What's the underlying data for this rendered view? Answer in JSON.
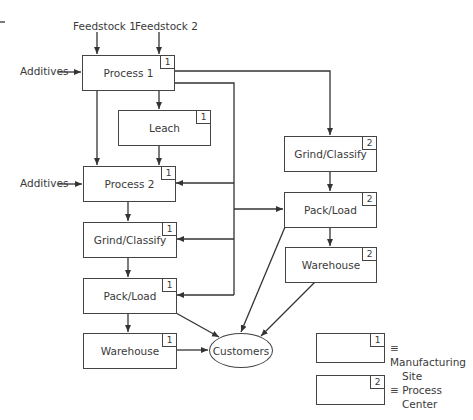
{
  "diagram": {
    "inputs": {
      "feedstock1": "Feedstock 1",
      "feedstock2": "Feedstock 2",
      "additives1": "Additives",
      "additives2": "Additives"
    },
    "site1": {
      "process1": {
        "label": "Process 1",
        "badge": "1"
      },
      "leach": {
        "label": "Leach",
        "badge": "1"
      },
      "process2": {
        "label": "Process 2",
        "badge": "1"
      },
      "grind": {
        "label": "Grind/Classify",
        "badge": "1"
      },
      "pack": {
        "label": "Pack/Load",
        "badge": "1"
      },
      "warehouse": {
        "label": "Warehouse",
        "badge": "1"
      }
    },
    "site2": {
      "grind": {
        "label": "Grind/Classify",
        "badge": "2"
      },
      "pack": {
        "label": "Pack/Load",
        "badge": "2"
      },
      "warehouse": {
        "label": "Warehouse",
        "badge": "2"
      }
    },
    "customers": "Customers",
    "legend": {
      "item1": {
        "badge": "1",
        "symbol": "≡",
        "line1": "Manufacturing",
        "line2": "Site"
      },
      "item2": {
        "badge": "2",
        "symbol": "≡",
        "line1": "Process",
        "line2": "Center"
      }
    },
    "colors": {
      "line": "#333333",
      "text": "#3a3a3a",
      "background": "#ffffff"
    }
  }
}
